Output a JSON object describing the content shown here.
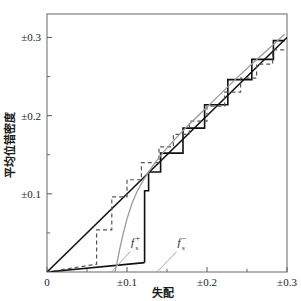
{
  "chart_data": {
    "type": "line",
    "title": "",
    "xlabel": "失配",
    "ylabel": "平均位错密度",
    "xlim": [
      0,
      0.3
    ],
    "ylim": [
      0,
      0.33
    ],
    "grid": false,
    "legend_position": "inline-annotation",
    "xticks": [
      0,
      0.1,
      0.2,
      0.3
    ],
    "xticklabels": [
      "0",
      "±0.1",
      "±0.2",
      "±0.3"
    ],
    "xminorticks": [
      0.05,
      0.15,
      0.25
    ],
    "yticks": [
      0.1,
      0.2,
      0.3
    ],
    "yticklabels": [
      "±0.1",
      "±0.2",
      "±0.3"
    ],
    "yminorticks": [
      0.05,
      0.15,
      0.25
    ],
    "annotations": [
      {
        "name": "f-plus-s",
        "text": "f",
        "sup": "+",
        "sub": "s",
        "x": 0.105,
        "y": 0.033
      },
      {
        "name": "f-minus-s",
        "text": "f",
        "sup": "−",
        "sub": "s",
        "x": 0.163,
        "y": 0.033
      }
    ],
    "series": [
      {
        "name": "diagonal-reference",
        "style": "solid",
        "color": "#111111",
        "width": 1.6,
        "points": [
          [
            0,
            0
          ],
          [
            0.3,
            0.3
          ]
        ]
      },
      {
        "name": "lower-solid-baseline",
        "style": "solid",
        "color": "#111111",
        "width": 1.6,
        "points": [
          [
            0,
            0
          ],
          [
            0.122,
            0.012
          ]
        ]
      },
      {
        "name": "staircase-solid",
        "style": "solid",
        "color": "#111111",
        "width": 1.6,
        "points": [
          [
            0.122,
            0.012
          ],
          [
            0.122,
            0.104
          ],
          [
            0.127,
            0.104
          ],
          [
            0.127,
            0.128
          ],
          [
            0.142,
            0.128
          ],
          [
            0.142,
            0.152
          ],
          [
            0.17,
            0.152
          ],
          [
            0.17,
            0.184
          ],
          [
            0.197,
            0.184
          ],
          [
            0.197,
            0.214
          ],
          [
            0.226,
            0.214
          ],
          [
            0.226,
            0.246
          ],
          [
            0.256,
            0.246
          ],
          [
            0.256,
            0.272
          ],
          [
            0.283,
            0.272
          ],
          [
            0.283,
            0.296
          ],
          [
            0.297,
            0.296
          ]
        ]
      },
      {
        "name": "staircase-dashed",
        "style": "dashed",
        "color": "#555555",
        "width": 1.2,
        "points": [
          [
            0.0,
            0.0
          ],
          [
            0.062,
            0.01
          ],
          [
            0.062,
            0.054
          ],
          [
            0.081,
            0.054
          ],
          [
            0.081,
            0.096
          ],
          [
            0.1,
            0.096
          ],
          [
            0.1,
            0.118
          ],
          [
            0.118,
            0.118
          ],
          [
            0.118,
            0.14
          ],
          [
            0.14,
            0.14
          ],
          [
            0.14,
            0.16
          ],
          [
            0.158,
            0.16
          ],
          [
            0.158,
            0.176
          ],
          [
            0.178,
            0.176
          ],
          [
            0.178,
            0.193
          ],
          [
            0.2,
            0.193
          ],
          [
            0.2,
            0.212
          ],
          [
            0.222,
            0.212
          ],
          [
            0.222,
            0.23
          ],
          [
            0.242,
            0.23
          ],
          [
            0.242,
            0.248
          ],
          [
            0.262,
            0.248
          ],
          [
            0.262,
            0.266
          ],
          [
            0.282,
            0.266
          ],
          [
            0.282,
            0.284
          ],
          [
            0.297,
            0.284
          ]
        ]
      },
      {
        "name": "smooth-gray-curve",
        "style": "solid",
        "color": "#9a9a9a",
        "width": 1.3,
        "points": [
          [
            0.085,
            0.0
          ],
          [
            0.088,
            0.014
          ],
          [
            0.091,
            0.03
          ],
          [
            0.095,
            0.048
          ],
          [
            0.1,
            0.068
          ],
          [
            0.106,
            0.087
          ],
          [
            0.113,
            0.104
          ],
          [
            0.122,
            0.12
          ],
          [
            0.133,
            0.137
          ],
          [
            0.146,
            0.154
          ],
          [
            0.16,
            0.17
          ],
          [
            0.176,
            0.187
          ],
          [
            0.194,
            0.205
          ],
          [
            0.214,
            0.225
          ],
          [
            0.236,
            0.247
          ],
          [
            0.258,
            0.268
          ],
          [
            0.28,
            0.288
          ],
          [
            0.297,
            0.304
          ]
        ]
      },
      {
        "name": "f-plus-s-leader",
        "style": "solid",
        "color": "#9a9a9a",
        "width": 0.9,
        "points": [
          [
            0.07,
            -0.012
          ],
          [
            0.104,
            0.026
          ]
        ]
      },
      {
        "name": "f-minus-s-leader",
        "style": "solid",
        "color": "#9a9a9a",
        "width": 0.9,
        "points": [
          [
            0.126,
            -0.012
          ],
          [
            0.162,
            0.026
          ]
        ]
      }
    ]
  },
  "axes": {
    "frame_color": "#808080",
    "tick_color": "#666666"
  }
}
